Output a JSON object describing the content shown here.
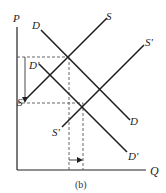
{
  "diagram": {
    "caption": "(b)",
    "axes": {
      "y_label": "P",
      "x_label": "Q"
    },
    "curves": [
      {
        "name": "D",
        "label": "D"
      },
      {
        "name": "S",
        "label": "S"
      },
      {
        "name": "S_prime",
        "label": "S'"
      },
      {
        "name": "D_prime_top",
        "label": "D'"
      },
      {
        "name": "D_prime_bottom",
        "label": "D'"
      },
      {
        "name": "S_prime_bottom",
        "label": "S'"
      }
    ],
    "annotations": {
      "price_drop_label": "S",
      "arrow_price": "down",
      "arrow_quantity": "right"
    },
    "colors": {
      "line": "#222222",
      "dashed": "#555555",
      "background": "#ffffff"
    }
  }
}
